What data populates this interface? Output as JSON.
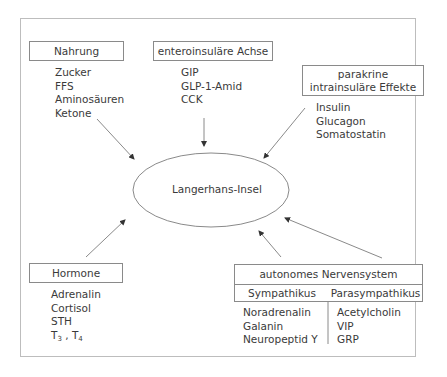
{
  "diagram": {
    "center": {
      "label": "Langerhans-Insel"
    },
    "nodes": {
      "nahrung": {
        "title": "Nahrung",
        "items": [
          "Zucker",
          "FFS",
          "Aminosäuren",
          "Ketone"
        ]
      },
      "enteroinsular": {
        "title": "enteroinsuläre Achse",
        "items": [
          "GIP",
          "GLP-1-Amid",
          "CCK"
        ]
      },
      "parakrin": {
        "title_line1": "parakrine",
        "title_line2": "intrainsuläre Effekte",
        "items": [
          "Insulin",
          "Glucagon",
          "Somatostatin"
        ]
      },
      "hormone": {
        "title": "Hormone",
        "items": [
          "Adrenalin",
          "Cortisol",
          "STH"
        ],
        "t_item": {
          "t": "T",
          "sub3": "3",
          "sep": " , ",
          "sub4": "4"
        }
      },
      "ans": {
        "title": "autonomes Nervensystem",
        "sympathikus": {
          "label": "Sympathikus",
          "items": [
            "Noradrenalin",
            "Galanin",
            "Neuropeptid Y"
          ]
        },
        "parasympathikus": {
          "label": "Parasympathikus",
          "items": [
            "Acetylcholin",
            "VIP",
            "GRP"
          ]
        }
      }
    },
    "colors": {
      "line": "#8a8a8a",
      "frame": "#bdbdbd",
      "text": "#3a3a3a"
    }
  }
}
